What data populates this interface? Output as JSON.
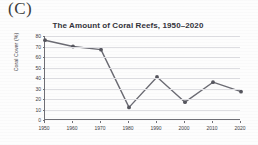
{
  "panel": {
    "label": "(C)"
  },
  "chart_data": {
    "type": "line",
    "title": "The Amount of Coral Reefs, 1950–2020",
    "xlabel": "",
    "ylabel": "Coral Cover (%)",
    "categories": [
      "1950",
      "1960",
      "1970",
      "1980",
      "1990",
      "2000",
      "2010",
      "2020"
    ],
    "values": [
      76,
      70,
      67,
      12,
      41,
      17,
      36,
      27
    ],
    "yticks": [
      "80",
      "70",
      "60",
      "50",
      "40",
      "30",
      "20",
      "10",
      "0"
    ],
    "ylim": [
      0,
      80
    ],
    "grid": "horizontal",
    "legend": "none",
    "series_color": "#6b6b73",
    "marker": "circle",
    "marker_color": "#55555d",
    "axis_color": "#6f6f76",
    "grid_color": "#dedee2",
    "text_color": "#3b3b42"
  }
}
